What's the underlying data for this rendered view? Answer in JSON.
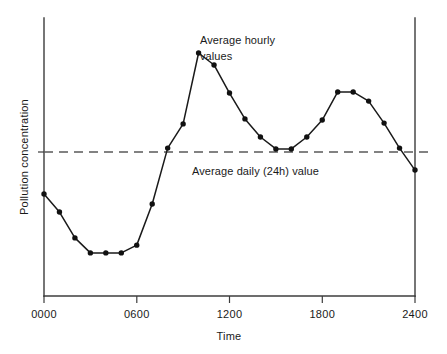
{
  "chart_data": {
    "type": "line",
    "title": "",
    "xlabel": "Time",
    "ylabel": "Pollution concentration",
    "xlim": [
      0,
      2400
    ],
    "ylim": [
      0,
      100
    ],
    "grid": false,
    "legend_position": "none",
    "x_tick_labels": [
      "0000",
      "0600",
      "1200",
      "1800",
      "2400"
    ],
    "x_tick_values": [
      0,
      600,
      1200,
      1800,
      2400
    ],
    "y_tick_labels": [],
    "series": [
      {
        "name": "Average hourly values",
        "x": [
          0,
          100,
          200,
          300,
          400,
          500,
          600,
          700,
          800,
          900,
          1000,
          1100,
          1200,
          1300,
          1400,
          1500,
          1600,
          1700,
          1800,
          1900,
          2000,
          2100,
          2200,
          2300,
          2400
        ],
        "values": [
          36.7,
          30.2,
          20.9,
          15.5,
          15.5,
          15.5,
          18.3,
          33.1,
          53.2,
          61.9,
          87.4,
          83.1,
          73.0,
          63.7,
          57.2,
          52.9,
          52.9,
          57.2,
          63.3,
          73.4,
          73.4,
          70.1,
          62.2,
          53.2,
          45.3
        ]
      }
    ],
    "reference_line": {
      "name": "Average daily (24h) value",
      "value": 51.8,
      "style": "dashed"
    },
    "annotations": [
      {
        "name": "hourly-annotation",
        "line1": "Average hourly",
        "line2": "values"
      },
      {
        "name": "daily-annotation",
        "text": "Average daily (24h) value"
      }
    ],
    "colors": {
      "line": "#1a1a1a",
      "marker": "#111111",
      "axis": "#3c3c3c",
      "reference": "#5a5a5a",
      "background": "#ffffff"
    }
  }
}
